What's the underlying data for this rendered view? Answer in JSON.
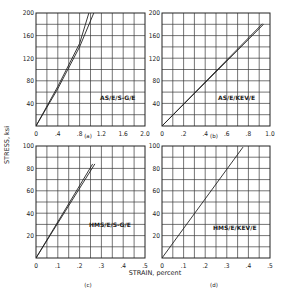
{
  "figure": {
    "ylabel": "STRESS, ksi",
    "xlabel": "STRAIN, percent"
  },
  "chart_data": [
    {
      "type": "line",
      "panel": "(a)",
      "annotation": "AS/E/S-G/E",
      "xlabel": "STRAIN, percent",
      "ylabel": "STRESS, ksi",
      "xlim": [
        0,
        2.0
      ],
      "ylim": [
        0,
        200
      ],
      "xticks": [
        "0",
        ".4",
        ".8",
        "1.2",
        "1.6",
        "2.0"
      ],
      "yticks": [
        "40",
        "80",
        "120",
        "160",
        "200"
      ],
      "grid": {
        "x_divisions": 10,
        "y_divisions": 10
      },
      "series": [
        {
          "name": "curve-1",
          "x": [
            0,
            0.4,
            0.8,
            0.97
          ],
          "y": [
            0,
            70,
            146,
            200
          ]
        },
        {
          "name": "curve-2",
          "x": [
            0,
            0.4,
            0.8,
            1.06
          ],
          "y": [
            0,
            66,
            140,
            200
          ]
        }
      ]
    },
    {
      "type": "line",
      "panel": "(b)",
      "annotation": "AS/E/KEV/E",
      "xlabel": "STRAIN, percent",
      "ylabel": "STRESS, ksi",
      "xlim": [
        0,
        1.0
      ],
      "ylim": [
        0,
        200
      ],
      "xticks": [
        "0",
        ".2",
        ".4",
        ".6",
        ".8",
        "1.0"
      ],
      "yticks": [
        "40",
        "80",
        "120",
        "160",
        "200"
      ],
      "grid": {
        "x_divisions": 10,
        "y_divisions": 10
      },
      "series": [
        {
          "name": "curve-1",
          "x": [
            0,
            0.93
          ],
          "y": [
            0,
            181
          ]
        },
        {
          "name": "curve-2",
          "x": [
            0,
            0.94
          ],
          "y": [
            0,
            180
          ]
        }
      ]
    },
    {
      "type": "line",
      "panel": "(c)",
      "annotation": "HMS/E/S-G/E",
      "xlabel": "STRAIN, percent",
      "ylabel": "STRESS, ksi",
      "xlim": [
        0,
        0.5
      ],
      "ylim": [
        0,
        100
      ],
      "xticks": [
        "0",
        ".1",
        ".2",
        ".3",
        ".4",
        ".5"
      ],
      "yticks": [
        "20",
        "40",
        "60",
        "80",
        "100"
      ],
      "grid": {
        "x_divisions": 10,
        "y_divisions": 10
      },
      "series": [
        {
          "name": "curve-1",
          "x": [
            0,
            0.26
          ],
          "y": [
            0,
            84
          ]
        },
        {
          "name": "curve-2",
          "x": [
            0,
            0.27
          ],
          "y": [
            0,
            84
          ]
        }
      ]
    },
    {
      "type": "line",
      "panel": "(d)",
      "annotation": "HMS/E/KEV/E",
      "xlabel": "STRAIN, percent",
      "ylabel": "STRESS, ksi",
      "xlim": [
        0,
        0.5
      ],
      "ylim": [
        0,
        100
      ],
      "xticks": [
        "0",
        ".1",
        ".2",
        ".3",
        ".4",
        ".5"
      ],
      "yticks": [
        "20",
        "40",
        "60",
        "80",
        "100"
      ],
      "grid": {
        "x_divisions": 10,
        "y_divisions": 10
      },
      "series": [
        {
          "name": "curve-1",
          "x": [
            0,
            0.375
          ],
          "y": [
            0,
            99
          ]
        }
      ]
    }
  ],
  "layout": {
    "panels": [
      {
        "x0": 36,
        "y0": 13,
        "x1": 145,
        "y1": 126,
        "annX": 100,
        "annY": 100,
        "capX": 88,
        "capY": 138
      },
      {
        "x0": 162,
        "y0": 13,
        "x1": 270,
        "y1": 126,
        "annX": 218,
        "annY": 100,
        "capX": 214,
        "capY": 138
      },
      {
        "x0": 36,
        "y0": 146,
        "x1": 145,
        "y1": 258,
        "annX": 89,
        "annY": 227,
        "capX": 88,
        "capY": 287
      },
      {
        "x0": 162,
        "y0": 146,
        "x1": 270,
        "y1": 258,
        "annX": 213,
        "annY": 230,
        "capX": 214,
        "capY": 287
      }
    ],
    "ylabel_pos": {
      "x": 9,
      "y": 145
    },
    "xlabel_pos": {
      "x": 155,
      "y": 275
    }
  }
}
